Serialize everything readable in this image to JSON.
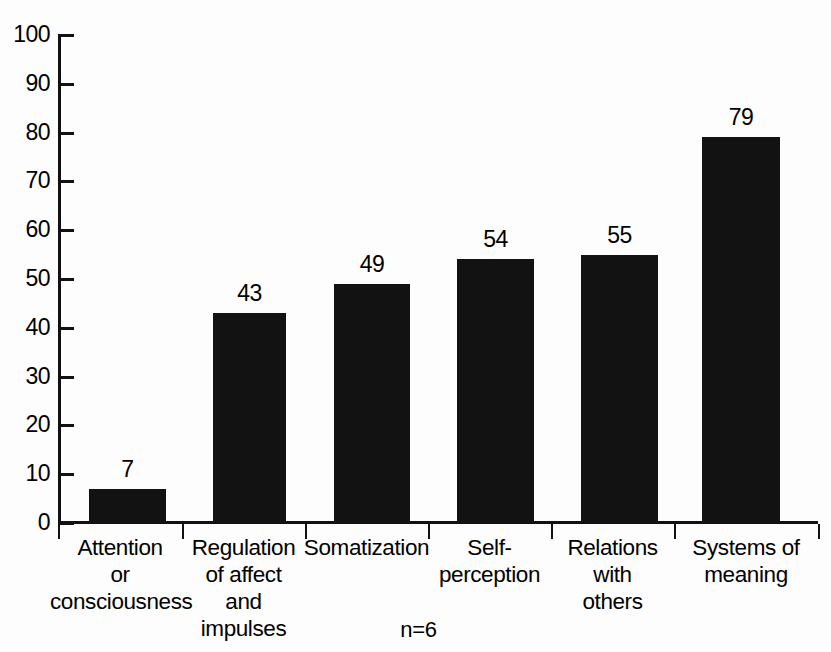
{
  "chart_data": {
    "type": "bar",
    "title": "",
    "subtitle": "",
    "xlabel": "",
    "ylabel": "",
    "ylim": [
      0,
      100
    ],
    "ytick_step": 10,
    "yticks": [
      100,
      90,
      80,
      70,
      60,
      50,
      40,
      30,
      20,
      10,
      0
    ],
    "grid": false,
    "legend": null,
    "legend_position": "none",
    "bar_color": "#121212",
    "axis_color": "#111111",
    "background_color": "#fdfdfd",
    "value_labels_shown": true,
    "categories": [
      "Attention or consciousness",
      "Regulation of affect and impulses",
      "Somatization",
      "Self-perception",
      "Relations with others",
      "Systems of meaning"
    ],
    "category_label_lines": [
      [
        "Attention",
        "or",
        "consciousness"
      ],
      [
        "Regulation",
        "of affect",
        "and",
        "impulses"
      ],
      [
        "Somatization"
      ],
      [
        "Self-",
        "perception"
      ],
      [
        "Relations",
        "with",
        "others"
      ],
      [
        "Systems of",
        "meaning"
      ]
    ],
    "values": [
      7,
      43,
      49,
      54,
      55,
      79
    ],
    "value_label_text": [
      "7",
      "43",
      "49",
      "54",
      "55",
      "79"
    ],
    "annotation": "n=6"
  }
}
